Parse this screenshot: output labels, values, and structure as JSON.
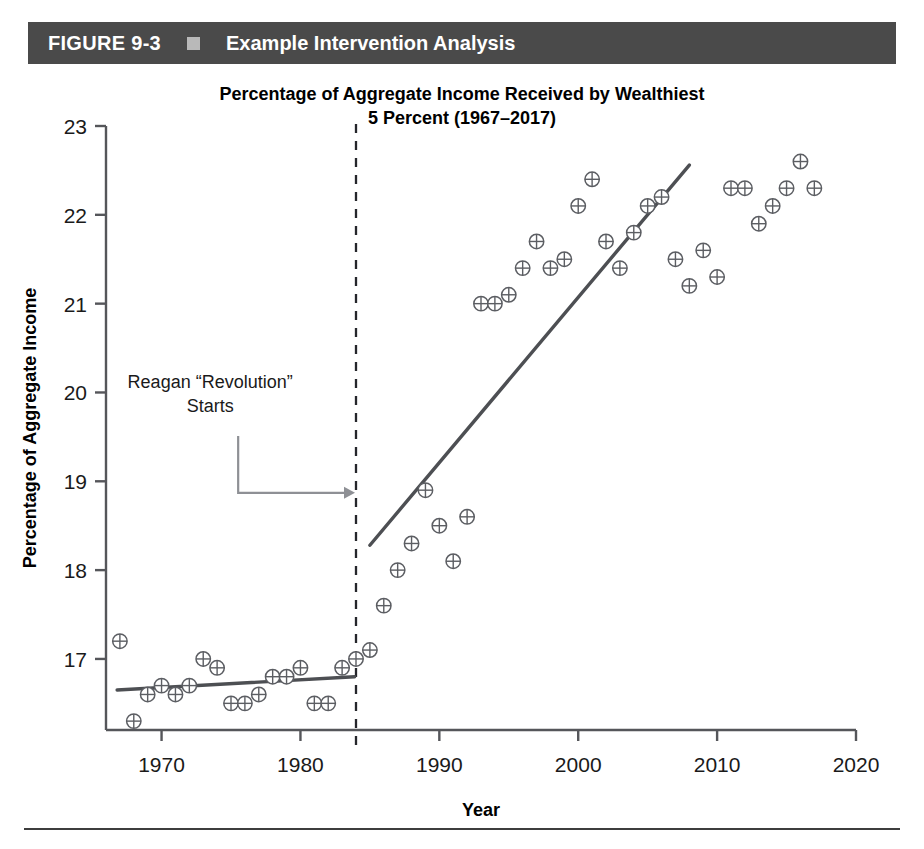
{
  "banner": {
    "figure_label": "FIGURE 9-3",
    "bullet_icon": "square-bullet-icon",
    "title": "Example Intervention Analysis",
    "background_color": "#4a4a4a",
    "text_color": "#ffffff"
  },
  "chart_data": {
    "type": "scatter",
    "title_line1": "Percentage of Aggregate Income Received by Wealthiest",
    "title_line2": "5 Percent (1967–2017)",
    "title": "Percentage of Aggregate Income Received by Wealthiest 5 Percent (1967–2017)",
    "xlabel": "Year",
    "ylabel": "Percentage of Aggregate Income",
    "xlim": [
      1966,
      2020
    ],
    "ylim": [
      16.2,
      23
    ],
    "xticks": [
      1970,
      1980,
      1990,
      2000,
      2010,
      2020
    ],
    "xtick_labels": [
      "1970",
      "1980",
      "1990",
      "2000",
      "2010",
      "2020"
    ],
    "yticks": [
      17,
      18,
      19,
      20,
      21,
      22,
      23
    ],
    "ytick_labels": [
      "17",
      "18",
      "19",
      "20",
      "21",
      "22",
      "23"
    ],
    "grid": false,
    "legend": null,
    "marker": "circle-plus",
    "x": [
      1967,
      1968,
      1969,
      1970,
      1971,
      1972,
      1973,
      1974,
      1975,
      1976,
      1977,
      1978,
      1979,
      1980,
      1981,
      1982,
      1983,
      1984,
      1985,
      1986,
      1987,
      1988,
      1989,
      1990,
      1991,
      1992,
      1993,
      1994,
      1995,
      1996,
      1997,
      1998,
      1999,
      2000,
      2001,
      2002,
      2003,
      2004,
      2005,
      2006,
      2007,
      2008,
      2009,
      2010,
      2011,
      2012,
      2013,
      2014,
      2015,
      2016,
      2017
    ],
    "y": [
      17.2,
      16.3,
      16.6,
      16.7,
      16.6,
      16.7,
      17.0,
      16.9,
      16.5,
      16.5,
      16.6,
      16.8,
      16.8,
      16.9,
      16.5,
      16.5,
      16.9,
      17.0,
      17.1,
      17.6,
      18.0,
      18.3,
      18.9,
      18.5,
      18.1,
      18.6,
      21.0,
      21.0,
      21.1,
      21.4,
      21.7,
      21.4,
      21.5,
      22.1,
      22.4,
      21.7,
      21.4,
      21.8,
      22.1,
      22.2,
      21.5,
      21.2,
      21.6,
      21.3,
      22.3,
      22.3,
      21.9,
      22.1,
      22.3,
      22.6,
      22.3
    ],
    "series": [
      {
        "name": "Pre-intervention points (1967–1983)",
        "x": [
          1967,
          1968,
          1969,
          1970,
          1971,
          1972,
          1973,
          1974,
          1975,
          1976,
          1977,
          1978,
          1979,
          1980,
          1981,
          1982,
          1983
        ],
        "values": [
          17.2,
          16.3,
          16.6,
          16.7,
          16.6,
          16.7,
          17.0,
          16.9,
          16.5,
          16.5,
          16.6,
          16.8,
          16.8,
          16.9,
          16.5,
          16.5,
          16.9
        ]
      },
      {
        "name": "Post-intervention points (1984–2017)",
        "x": [
          1984,
          1985,
          1986,
          1987,
          1988,
          1989,
          1990,
          1991,
          1992,
          1993,
          1994,
          1995,
          1996,
          1997,
          1998,
          1999,
          2000,
          2001,
          2002,
          2003,
          2004,
          2005,
          2006,
          2007,
          2008,
          2009,
          2010,
          2011,
          2012,
          2013,
          2014,
          2015,
          2016,
          2017
        ],
        "values": [
          17.0,
          17.1,
          17.6,
          18.0,
          18.3,
          18.9,
          18.5,
          18.1,
          18.6,
          21.0,
          21.0,
          21.1,
          21.4,
          21.7,
          21.4,
          21.5,
          22.1,
          22.4,
          21.7,
          21.4,
          21.8,
          22.1,
          22.2,
          21.5,
          21.2,
          21.6,
          21.3,
          22.3,
          22.3,
          21.9,
          22.1,
          22.3,
          22.6,
          22.3
        ]
      }
    ],
    "trend_lines": [
      {
        "name": "pre-intervention-trend",
        "x": [
          1966.8,
          1983.9
        ],
        "y": [
          16.65,
          16.8
        ]
      },
      {
        "name": "post-intervention-trend",
        "x": [
          1985.0,
          2008.0
        ],
        "y": [
          18.28,
          22.56
        ]
      }
    ],
    "intervention": {
      "name": "reagan-revolution-marker",
      "year": 1984,
      "line_style": "dashed",
      "annotation_line1": "Reagan “Revolution”",
      "annotation_line2": "Starts",
      "annotation_x": 1973.5,
      "annotation_y": 20.05
    },
    "colors": {
      "point": "#5c5e63",
      "trend": "#4d4f53",
      "axis": "#55565a",
      "intervention": "#25262b",
      "annotation_arrow": "#8e9095"
    }
  }
}
